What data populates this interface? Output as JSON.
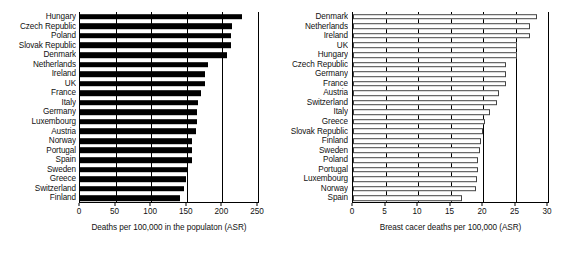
{
  "figure": {
    "background": "#ffffff",
    "bar_solid_color": "#000000",
    "bar_hollow_fill": "#ffffff",
    "bar_hollow_stroke": "#444444",
    "axis_color": "#000000"
  },
  "chart_data": [
    {
      "id": "left",
      "type": "bar",
      "orientation": "horizontal",
      "title": "",
      "xlabel": "Deaths per 100,000 in the populaton (ASR)",
      "ylabel": "",
      "xlim": [
        0,
        250
      ],
      "xticks": [
        0,
        50,
        100,
        150,
        200,
        250
      ],
      "xticklabels": [
        "0",
        "50",
        "100",
        "150",
        "200",
        "250"
      ],
      "grid": true,
      "legend": false,
      "bar_style": "filled",
      "categories": [
        "Hungary",
        "Czech Republic",
        "Poland",
        "Slovak Republic",
        "Denmark",
        "Netherlands",
        "Ireland",
        "UK",
        "France",
        "Italy",
        "Germany",
        "Luxembourg",
        "Austria",
        "Norway",
        "Portugal",
        "Spain",
        "Sweden",
        "Greece",
        "Switzerland",
        "Finland"
      ],
      "values": [
        228,
        213,
        212,
        212,
        206,
        180,
        176,
        175,
        170,
        166,
        164,
        164,
        163,
        158,
        157,
        157,
        150,
        149,
        146,
        141
      ]
    },
    {
      "id": "right",
      "type": "bar",
      "orientation": "horizontal",
      "title": "",
      "xlabel": "Breast cacer deaths per 100,000 (ASR)",
      "ylabel": "",
      "xlim": [
        0,
        30
      ],
      "xticks": [
        0,
        5,
        10,
        15,
        20,
        25,
        30
      ],
      "xticklabels": [
        "0",
        "5",
        "10",
        "15",
        "20",
        "25",
        "30"
      ],
      "grid": true,
      "legend": false,
      "bar_style": "outlined",
      "categories": [
        "Denmark",
        "Netherlands",
        "Ireland",
        "UK",
        "Hungary",
        "Czech Republic",
        "Germany",
        "France",
        "Austria",
        "Switzerland",
        "Italy",
        "Greece",
        "Slovak Republic",
        "Finland",
        "Sweden",
        "Poland",
        "Portugal",
        "Luxembourg",
        "Norway",
        "Spain"
      ],
      "values": [
        28.3,
        27.2,
        27.2,
        25.3,
        25.3,
        23.5,
        23.5,
        23.5,
        22.5,
        22.2,
        21.1,
        20.3,
        20.0,
        19.7,
        19.5,
        19.2,
        19.2,
        19.0,
        18.9,
        16.8
      ]
    }
  ]
}
